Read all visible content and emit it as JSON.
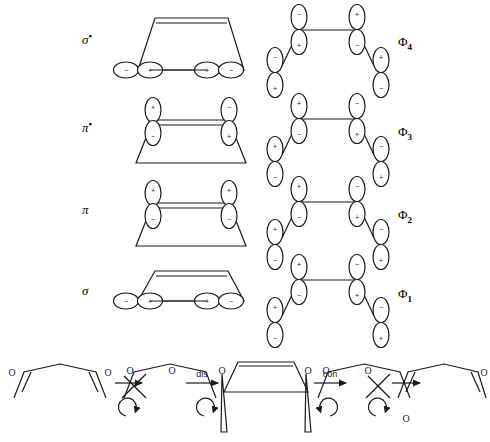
{
  "diagram": {
    "type": "correlation-diagram",
    "rows": [
      {
        "left_label": "σ",
        "left_star": "▪",
        "left_molecule": "cyclobutene",
        "right_label": "Φ",
        "right_sub": "4",
        "right_molecule": "butadiene",
        "left_signs": [
          "−",
          "+",
          "+",
          "−"
        ],
        "right_signs": [
          "−",
          "+",
          "+",
          "−",
          "−",
          "+",
          "+",
          "−"
        ]
      },
      {
        "left_label": "π",
        "left_star": "▪",
        "left_molecule": "cyclobutene",
        "right_label": "Φ",
        "right_sub": "3",
        "right_molecule": "butadiene",
        "left_signs": [
          "+",
          "−",
          "−",
          "+"
        ],
        "right_signs": [
          "+",
          "−",
          "−",
          "+",
          "+",
          "−",
          "−",
          "+"
        ]
      },
      {
        "left_label": "π",
        "left_star": "",
        "left_molecule": "cyclobutene",
        "right_label": "Φ",
        "right_sub": "2",
        "right_molecule": "butadiene",
        "left_signs": [
          "+",
          "−",
          "+",
          "−"
        ],
        "right_signs": [
          "+",
          "−",
          "−",
          "+",
          "+",
          "−",
          "−",
          "+"
        ]
      },
      {
        "left_label": "σ",
        "left_star": "",
        "left_molecule": "cyclobutene",
        "right_label": "Φ",
        "right_sub": "1",
        "right_molecule": "butadiene",
        "left_signs": [
          "−",
          "+",
          "+",
          "−"
        ],
        "right_signs": [
          "+",
          "−",
          "−",
          "+",
          "+",
          "−",
          "−",
          "+"
        ]
      }
    ]
  },
  "scheme": {
    "name": "ring-opening-stereochemistry",
    "labels": {
      "dis": "dis",
      "con": "con"
    },
    "substituent": "O",
    "steps": [
      {
        "id": "product-left",
        "kind": "diene"
      },
      {
        "id": "arrow-left-outer",
        "kind": "arrow",
        "direction": "left"
      },
      {
        "id": "ts-left",
        "kind": "open-chain"
      },
      {
        "id": "arrow-dis",
        "kind": "arrow",
        "direction": "left",
        "label": "dis"
      },
      {
        "id": "cyclobutene",
        "kind": "ring"
      },
      {
        "id": "arrow-con",
        "kind": "arrow",
        "direction": "right",
        "label": "con"
      },
      {
        "id": "ts-right",
        "kind": "open-chain"
      },
      {
        "id": "arrow-right-outer",
        "kind": "arrow",
        "direction": "right"
      },
      {
        "id": "product-right",
        "kind": "diene"
      }
    ]
  },
  "colors": {
    "ink": "#1a1a1a",
    "paper": "#ffffff"
  }
}
